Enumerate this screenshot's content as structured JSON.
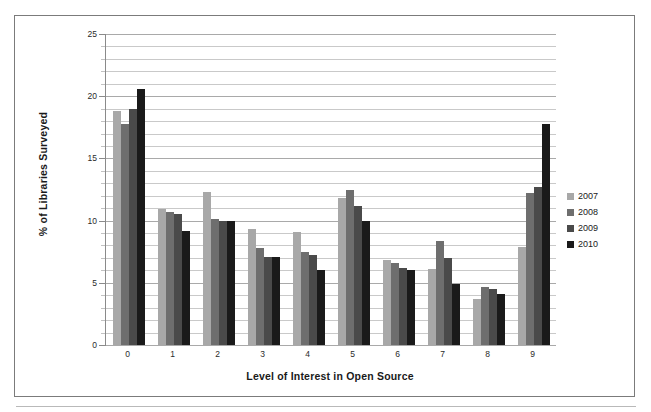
{
  "chart_data": {
    "type": "bar",
    "title": "",
    "subtitle": "",
    "xlabel": "Level of Interest in Open Source",
    "ylabel": "% of Libraries Surveyed",
    "categories": [
      "0",
      "1",
      "2",
      "3",
      "4",
      "5",
      "6",
      "7",
      "8",
      "9"
    ],
    "series": [
      {
        "name": "2007",
        "color": "#a8a8a8",
        "values": [
          18.8,
          10.9,
          12.3,
          9.3,
          9.1,
          11.8,
          6.8,
          6.1,
          3.7,
          7.9
        ]
      },
      {
        "name": "2008",
        "color": "#6e6e6e",
        "values": [
          17.8,
          10.7,
          10.1,
          7.8,
          7.5,
          12.5,
          6.6,
          8.4,
          4.7,
          12.2
        ]
      },
      {
        "name": "2009",
        "color": "#4a4a4a",
        "values": [
          19.0,
          10.5,
          10.0,
          7.1,
          7.2,
          11.2,
          6.2,
          7.0,
          4.5,
          12.7
        ]
      },
      {
        "name": "2010",
        "color": "#1a1a1a",
        "values": [
          20.6,
          9.2,
          10.0,
          7.1,
          6.0,
          10.0,
          6.0,
          4.9,
          4.1,
          17.8
        ]
      }
    ],
    "ylim": [
      0,
      25
    ],
    "y_major_ticks": [
      0,
      5,
      10,
      15,
      20,
      25
    ],
    "y_minor_step": 1,
    "grid": true,
    "grid_axis": "y",
    "legend_position": "right",
    "y_tick_labels": [
      "0",
      "5",
      "10",
      "15",
      "20",
      "25"
    ]
  },
  "legend": {
    "entries": [
      {
        "label": "2007",
        "color": "#a8a8a8"
      },
      {
        "label": "2008",
        "color": "#6e6e6e"
      },
      {
        "label": "2009",
        "color": "#4a4a4a"
      },
      {
        "label": "2010",
        "color": "#1a1a1a"
      }
    ]
  }
}
